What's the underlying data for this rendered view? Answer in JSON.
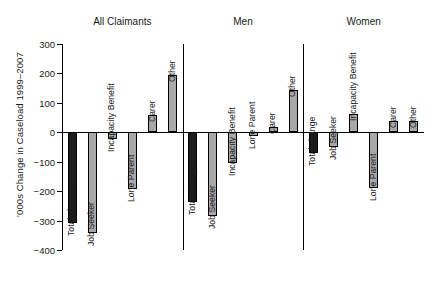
{
  "chart_data": {
    "type": "bar",
    "title": "",
    "xlabel": "",
    "ylabel": "'000s Change in Caseload 1999–2007",
    "ylim": [
      -400,
      300
    ],
    "yticks": [
      300,
      200,
      100,
      0,
      -100,
      -200,
      -300,
      -400
    ],
    "ytick_labels": [
      "300",
      "200",
      "100",
      "0",
      "−100",
      "−200",
      "−300",
      "−400"
    ],
    "grid": false,
    "legend": "none",
    "categories": [
      "Total change",
      "Job Seeker",
      "Incapacity Benefit",
      "Lone Parent",
      "Carer",
      "Other"
    ],
    "panels": [
      {
        "name": "All Claimants",
        "values": [
          -308,
          -341,
          -22,
          -193,
          60,
          194
        ]
      },
      {
        "name": "Men",
        "values": [
          -237,
          -283,
          -104,
          -13,
          18,
          145
        ]
      },
      {
        "name": "Women",
        "values": [
          -72,
          -50,
          62,
          -190,
          37,
          38
        ]
      }
    ],
    "colors": {
      "total_change_bar": "#1c1c1c",
      "other_bars": "#a8a8a8",
      "axis": "#000000",
      "background": "#ffffff"
    }
  }
}
